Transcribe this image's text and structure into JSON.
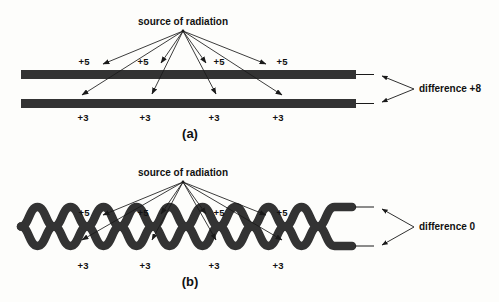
{
  "figure": {
    "colors": {
      "strand": "#333333",
      "ray": "#1a1a1a",
      "background": "#fdfdfb",
      "text": "#111111"
    }
  },
  "panels": [
    {
      "id": "a",
      "panel_label": "(a)",
      "source_label": "source of radiation",
      "difference_label": "difference +8",
      "upper_doses": [
        "+5",
        "+5",
        "+5",
        "+5"
      ],
      "lower_doses": [
        "+3",
        "+3",
        "+3",
        "+3"
      ],
      "upper_dose_total": "+5",
      "lower_dose_total": "+3",
      "strand_type": "straight-parallel"
    },
    {
      "id": "b",
      "panel_label": "(b)",
      "source_label": "source of radiation",
      "difference_label": "difference 0",
      "upper_doses": [
        "+5",
        "+5",
        "+5",
        "+5"
      ],
      "lower_doses": [
        "+3",
        "+3",
        "+3",
        "+3"
      ],
      "upper_dose_total": "+5",
      "lower_dose_total": "+3",
      "strand_type": "twisted-helix"
    }
  ]
}
